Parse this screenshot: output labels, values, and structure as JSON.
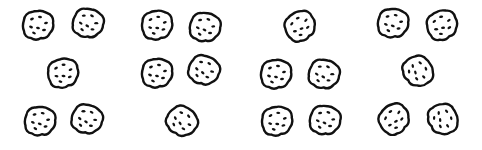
{
  "colors": {
    "outline": "#111111",
    "fill": "#ffffff",
    "chip": "#111111",
    "background": "#ffffff"
  },
  "groups": [
    {
      "label": "group-1",
      "count": 5,
      "arrangement": "2-1-2",
      "cookies": [
        {
          "x": 38,
          "y": 25,
          "r": 0
        },
        {
          "x": 88,
          "y": 23,
          "r": 15
        },
        {
          "x": 63,
          "y": 73,
          "r": -10
        },
        {
          "x": 40,
          "y": 121,
          "r": 5
        },
        {
          "x": 87,
          "y": 119,
          "r": 20
        }
      ]
    },
    {
      "label": "group-2",
      "count": 5,
      "arrangement": "2-2-1",
      "cookies": [
        {
          "x": 157,
          "y": 25,
          "r": -5
        },
        {
          "x": 205,
          "y": 27,
          "r": 10
        },
        {
          "x": 157,
          "y": 73,
          "r": 0
        },
        {
          "x": 204,
          "y": 70,
          "r": 25
        },
        {
          "x": 182,
          "y": 121,
          "r": 40
        }
      ]
    },
    {
      "label": "group-3",
      "count": 5,
      "arrangement": "1-2-2",
      "cookies": [
        {
          "x": 300,
          "y": 26,
          "r": -30
        },
        {
          "x": 276,
          "y": 74,
          "r": 0
        },
        {
          "x": 324,
          "y": 74,
          "r": 15
        },
        {
          "x": 277,
          "y": 121,
          "r": -5
        },
        {
          "x": 325,
          "y": 120,
          "r": 10
        }
      ]
    },
    {
      "label": "group-4",
      "count": 5,
      "arrangement": "2-1-2",
      "cookies": [
        {
          "x": 393,
          "y": 23,
          "r": 5
        },
        {
          "x": 442,
          "y": 25,
          "r": -20
        },
        {
          "x": 418,
          "y": 71,
          "r": 60
        },
        {
          "x": 394,
          "y": 119,
          "r": -40
        },
        {
          "x": 443,
          "y": 119,
          "r": 70
        }
      ]
    }
  ]
}
